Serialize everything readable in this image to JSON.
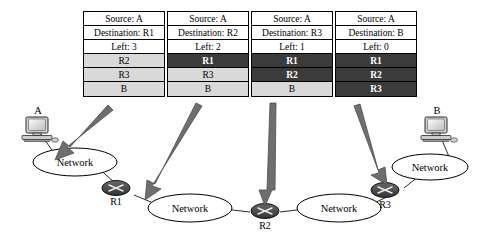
{
  "figure": {
    "title_present": false,
    "colors": {
      "consumed_hop_bg": "#3b3b3b",
      "consumed_hop_text": "#ffffff",
      "remaining_hop_bg": "#d9d9d9",
      "remaining_hop_text": "#000000",
      "header_bg": "#ffffff",
      "arrow": "#6e6e6e",
      "router_fill": "#4a4a4a",
      "network_fill": "#ffffff",
      "stroke": "#000000"
    }
  },
  "packets": [
    {
      "id": "packet-1",
      "header": {
        "source_label": "Source: A",
        "destination_label": "Destination: R1",
        "left_label": "Left: 3"
      },
      "stack": [
        {
          "label": "R2",
          "state": "remaining"
        },
        {
          "label": "R3",
          "state": "remaining"
        },
        {
          "label": "B",
          "state": "remaining"
        }
      ]
    },
    {
      "id": "packet-2",
      "header": {
        "source_label": "Source: A",
        "destination_label": "Destination: R2",
        "left_label": "Left: 2"
      },
      "stack": [
        {
          "label": "R1",
          "state": "consumed"
        },
        {
          "label": "R3",
          "state": "remaining"
        },
        {
          "label": "B",
          "state": "remaining"
        }
      ]
    },
    {
      "id": "packet-3",
      "header": {
        "source_label": "Source: A",
        "destination_label": "Destination: R3",
        "left_label": "Left: 1"
      },
      "stack": [
        {
          "label": "R1",
          "state": "consumed"
        },
        {
          "label": "R2",
          "state": "consumed"
        },
        {
          "label": "B",
          "state": "remaining"
        }
      ]
    },
    {
      "id": "packet-4",
      "header": {
        "source_label": "Source: A",
        "destination_label": "Destination: B",
        "left_label": "Left: 0"
      },
      "stack": [
        {
          "label": "R1",
          "state": "consumed"
        },
        {
          "label": "R2",
          "state": "consumed"
        },
        {
          "label": "R3",
          "state": "consumed"
        }
      ]
    }
  ],
  "topology": {
    "hosts": [
      {
        "id": "host-a",
        "label": "A"
      },
      {
        "id": "host-b",
        "label": "B"
      }
    ],
    "clouds": [
      {
        "id": "network-1",
        "label": "Network"
      },
      {
        "id": "network-2",
        "label": "Network"
      },
      {
        "id": "network-3",
        "label": "Network"
      },
      {
        "id": "network-4",
        "label": "Network"
      }
    ],
    "routers": [
      {
        "id": "router-r1",
        "label": "R1"
      },
      {
        "id": "router-r2",
        "label": "R2"
      },
      {
        "id": "router-r3",
        "label": "R3"
      }
    ],
    "arrows": [
      {
        "id": "arrow-packet-1",
        "from_packet": "packet-1",
        "points_to": "network-1"
      },
      {
        "id": "arrow-packet-2",
        "from_packet": "packet-2",
        "points_to": "router-r1"
      },
      {
        "id": "arrow-packet-3",
        "from_packet": "packet-3",
        "points_to": "router-r2"
      },
      {
        "id": "arrow-packet-4",
        "from_packet": "packet-4",
        "points_to": "router-r3"
      }
    ]
  }
}
